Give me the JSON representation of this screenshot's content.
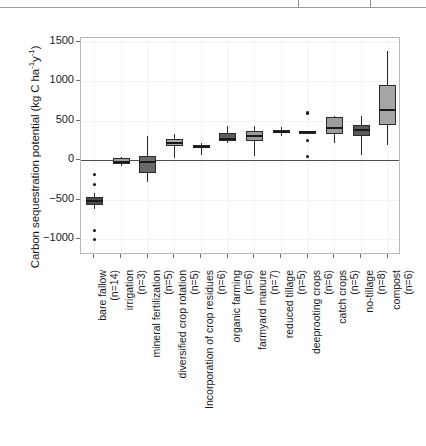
{
  "figure": {
    "ylabel_text": "Carbon sequestration potential (kg C ha",
    "ylabel_sup1": "-1",
    "ylabel_mid": "y",
    "ylabel_sup2": "-1",
    "ylabel_tail": ")"
  },
  "chart_data": {
    "type": "box",
    "title": "",
    "xlabel": "",
    "ylabel": "Carbon sequestration potential (kg C ha-1y-1)",
    "ylim": [
      -1200,
      1550
    ],
    "yticks": [
      1500,
      1000,
      500,
      0,
      -500,
      -1000
    ],
    "ytick_labels": [
      "1500",
      "1000",
      "500",
      "0",
      "-500",
      "-1000"
    ],
    "grid": true,
    "legend": "none",
    "zero_reference_line": 0,
    "categories": [
      "bare fallow",
      "irrigation",
      "mineral fertilization",
      "diversified crop rotation",
      "Incorporation of crop residues",
      "organic farming",
      "farmyard manure",
      "reduced tillage",
      "deeprooting crops",
      "catch crops",
      "no-tillage",
      "compost"
    ],
    "counts": [
      "(n=14)",
      "(n=3)",
      "(n=5)",
      "(n=5)",
      "(n=6)",
      "(n=6)",
      "(n=7)",
      "(n=5)",
      "(n=6)",
      "(n=5)",
      "(n=8)",
      "(n=6)"
    ],
    "boxes": [
      {
        "name": "bare fallow",
        "n": 14,
        "whisker_low": -620,
        "q1": -570,
        "median": -515,
        "q3": -470,
        "whisker_high": -420,
        "outliers": [
          -180,
          -310,
          -890,
          -1000
        ],
        "fill": "#4a4a4a"
      },
      {
        "name": "irrigation",
        "n": 3,
        "whisker_low": -70,
        "q1": -45,
        "median": -20,
        "q3": 25,
        "whisker_high": 40,
        "outliers": [],
        "fill": "#9e9e9e"
      },
      {
        "name": "mineral fertilization",
        "n": 5,
        "whisker_low": -275,
        "q1": -165,
        "median": -25,
        "q3": 50,
        "whisker_high": 310,
        "outliers": [],
        "fill": "#6a6a6a"
      },
      {
        "name": "diversified crop rotation",
        "n": 5,
        "whisker_low": 35,
        "q1": 185,
        "median": 225,
        "q3": 270,
        "whisker_high": 330,
        "outliers": [],
        "fill": "#a8a8a8"
      },
      {
        "name": "Incorporation of crop residues",
        "n": 6,
        "whisker_low": 70,
        "q1": 150,
        "median": 170,
        "q3": 190,
        "whisker_high": 215,
        "outliers": [],
        "fill": "#b4b4b4"
      },
      {
        "name": "organic farming",
        "n": 6,
        "whisker_low": 215,
        "q1": 245,
        "median": 275,
        "q3": 340,
        "whisker_high": 435,
        "outliers": [],
        "fill": "#5e5e5e"
      },
      {
        "name": "farmyard manure",
        "n": 7,
        "whisker_low": 60,
        "q1": 250,
        "median": 310,
        "q3": 370,
        "whisker_high": 435,
        "outliers": [],
        "fill": "#9a9a9a"
      },
      {
        "name": "reduced tillage",
        "n": 5,
        "whisker_low": 310,
        "q1": 345,
        "median": 365,
        "q3": 385,
        "whisker_high": 420,
        "outliers": [],
        "fill": "#4f4f4f"
      },
      {
        "name": "deeprooting crops",
        "n": 6,
        "whisker_low": 340,
        "q1": 345,
        "median": 355,
        "q3": 365,
        "whisker_high": 370,
        "outliers": [
          600,
          250,
          45
        ],
        "fill": "#a0a0a0"
      },
      {
        "name": "catch crops",
        "n": 5,
        "whisker_low": 215,
        "q1": 330,
        "median": 410,
        "q3": 550,
        "whisker_high": 560,
        "outliers": [],
        "fill": "#9c9c9c"
      },
      {
        "name": "no-tillage",
        "n": 8,
        "whisker_low": 70,
        "q1": 310,
        "median": 385,
        "q3": 450,
        "whisker_high": 560,
        "outliers": [],
        "fill": "#5a5a5a"
      },
      {
        "name": "compost",
        "n": 6,
        "whisker_low": 190,
        "q1": 450,
        "median": 640,
        "q3": 950,
        "whisker_high": 1390,
        "outliers": [],
        "fill": "#a6a6a6"
      }
    ]
  }
}
